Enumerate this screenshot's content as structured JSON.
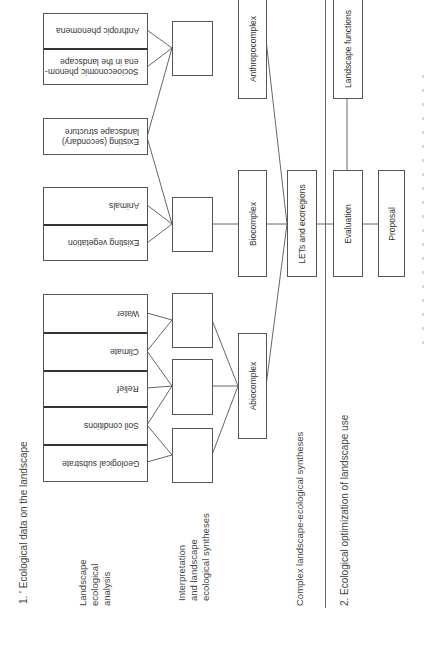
{
  "diagram": {
    "sections": {
      "one": "1. ' Ecological data on the landscape",
      "two": "2.  Ecological optimization of landscape use"
    },
    "row_labels": {
      "analysis": [
        "Landscape",
        "ecological",
        "analysis"
      ],
      "interpretation": [
        "Interpretation",
        "and landscape",
        "ecological syntheses"
      ],
      "complex": "Complex landscape-ecological syntheses"
    },
    "inputs": {
      "anthropic": "Anthropic phenomena",
      "socioeconomic": [
        "Socioeconomic phenom-",
        "ena in the landscape"
      ],
      "existing_structure": [
        "Existing (secondary)",
        "landscape structure"
      ],
      "animals": "Animals",
      "existing_vegetation": "Existing vegetation",
      "water": "Water",
      "climate": "Climate",
      "relief": "Relief",
      "soil": "Soil conditions",
      "geological": "Geological substrate"
    },
    "complexes": {
      "anthropocomplex": "Anthropocomplex",
      "biocomplex": "Biocomplex",
      "abiocomplex": "Abiocomplex"
    },
    "lets": "LETs and ecoregions",
    "optimization": {
      "landscape_functions": "Landscape functions",
      "evaluation": "Evaluation",
      "proposal": "Proposal"
    },
    "colors": {
      "line": "#555555",
      "text": "#333333",
      "background": "#ffffff"
    }
  }
}
